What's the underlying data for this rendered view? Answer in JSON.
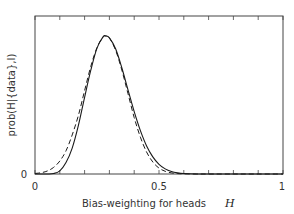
{
  "chart_data": {
    "type": "line",
    "title": "",
    "xlabel": "Bias-weighting for heads",
    "xlabel_var": "H",
    "ylabel": "prob(H|{data},I)",
    "xlim": [
      0,
      1
    ],
    "ylim": [
      0,
      1.16
    ],
    "x_ticks": [
      0,
      0.1,
      0.2,
      0.3,
      0.4,
      0.5,
      0.6,
      0.7,
      0.8,
      0.9,
      1.0
    ],
    "x_tick_labels": [
      {
        "value": 0,
        "label": "0"
      },
      {
        "value": 0.5,
        "label": "0.5"
      },
      {
        "value": 1,
        "label": "1"
      }
    ],
    "y_tick_labels": [
      {
        "value": 0,
        "label": "0"
      }
    ],
    "grid": false,
    "legend": null,
    "x": [
      0,
      0.025,
      0.05,
      0.075,
      0.1,
      0.125,
      0.15,
      0.175,
      0.2,
      0.225,
      0.25,
      0.275,
      0.2857,
      0.3,
      0.325,
      0.35,
      0.375,
      0.4,
      0.425,
      0.45,
      0.475,
      0.5,
      0.525,
      0.55,
      0.575,
      0.6,
      0.65,
      0.7,
      0.8,
      0.9,
      1.0
    ],
    "series": [
      {
        "name": "posterior (exact)",
        "style": "solid",
        "values": [
          0,
          2e-06,
          0.00026,
          0.0033,
          0.023,
          0.083,
          0.188,
          0.352,
          0.556,
          0.752,
          0.912,
          0.995,
          1.0,
          0.986,
          0.907,
          0.77,
          0.61,
          0.452,
          0.314,
          0.203,
          0.124,
          0.07,
          0.037,
          0.018,
          0.0082,
          0.0035,
          0.0005,
          5e-05,
          0,
          0,
          0
        ]
      },
      {
        "name": "Gaussian approximation",
        "style": "dashed",
        "values": [
          0.0037,
          0.0094,
          0.022,
          0.048,
          0.094,
          0.168,
          0.283,
          0.425,
          0.604,
          0.78,
          0.916,
          0.993,
          1.0,
          0.986,
          0.897,
          0.754,
          0.582,
          0.409,
          0.267,
          0.159,
          0.087,
          0.043,
          0.0196,
          0.0083,
          0.0032,
          0.0012,
          0.00011,
          1e-05,
          0,
          0,
          0
        ]
      }
    ]
  },
  "colors": {
    "line": "#1a1a1a",
    "frame": "#444444",
    "text": "#333333",
    "background": "#ffffff"
  }
}
